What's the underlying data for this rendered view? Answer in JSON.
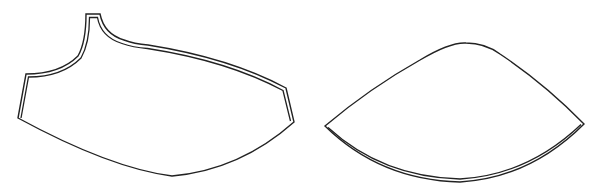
{
  "figure": {
    "pieces": [
      {
        "id": "left-piece",
        "label": "",
        "shape": "one-shoulder bodice piece with seam allowance on top and sides"
      },
      {
        "id": "right-piece",
        "label": "",
        "shape": "cone/wedge piece with seam allowance on bottom curve"
      }
    ],
    "colors": {
      "stroke": "#222222",
      "background": "#ffffff"
    }
  }
}
